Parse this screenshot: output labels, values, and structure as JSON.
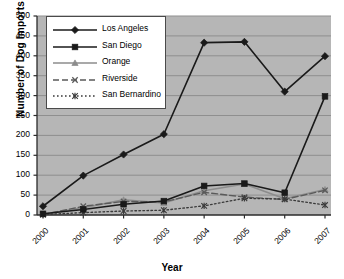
{
  "chart_data": {
    "type": "line",
    "title": "",
    "xlabel": "Year",
    "ylabel": "Number of Dog Imports",
    "categories": [
      "2000",
      "2001",
      "2002",
      "2003",
      "2004",
      "2005",
      "2006",
      "2007"
    ],
    "x": [
      2000,
      2001,
      2002,
      2003,
      2004,
      2005,
      2006,
      2007
    ],
    "ylim": [
      0,
      500
    ],
    "yticks": [
      0,
      50,
      100,
      150,
      200,
      250,
      300,
      350,
      400,
      450,
      500
    ],
    "grid": true,
    "legend_position": "top-left",
    "series": [
      {
        "name": "Los Angeles",
        "marker": "diamond",
        "line": "solid",
        "color": "#1a1a1a",
        "values": [
          22,
          99,
          152,
          203,
          433,
          435,
          310,
          399
        ]
      },
      {
        "name": "San Diego",
        "marker": "square",
        "line": "solid",
        "color": "#1a1a1a",
        "values": [
          3,
          14,
          27,
          35,
          73,
          79,
          56,
          298
        ]
      },
      {
        "name": "Orange",
        "marker": "triangle",
        "line": "solid",
        "color": "#8c8c8c",
        "values": [
          2,
          18,
          38,
          30,
          61,
          78,
          41,
          64
        ]
      },
      {
        "name": "Riverside",
        "marker": "x",
        "line": "dashed",
        "color": "#5a5a5a",
        "values": [
          1,
          22,
          34,
          33,
          57,
          45,
          39,
          62
        ]
      },
      {
        "name": "San Bernardino",
        "marker": "asterisk",
        "line": "dotted",
        "color": "#3a3a3a",
        "values": [
          1,
          6,
          10,
          12,
          23,
          42,
          40,
          25
        ]
      }
    ]
  },
  "legend": {
    "items": [
      {
        "label": "Los Angeles"
      },
      {
        "label": "San Diego"
      },
      {
        "label": "Orange"
      },
      {
        "label": "Riverside"
      },
      {
        "label": "San Bernardino"
      }
    ]
  },
  "axes": {
    "y_title": "Number of Dog Imports",
    "x_title": "Year",
    "y_ticks": [
      "500",
      "450",
      "400",
      "350",
      "300",
      "250",
      "200",
      "150",
      "100",
      "50",
      "0"
    ],
    "x_ticks": [
      "2000",
      "2001",
      "2002",
      "2003",
      "2004",
      "2005",
      "2006",
      "2007"
    ]
  },
  "colors": {
    "plot_background": "#b6b6b6",
    "gridline": "#8f8f8f",
    "axis": "#2b2b2b",
    "page_background": "#ffffff"
  }
}
